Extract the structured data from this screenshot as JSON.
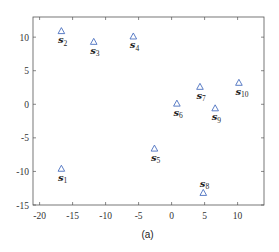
{
  "caption": "(a)",
  "colors": {
    "marker": "#4a6fc0",
    "axis": "#555555",
    "text": "#222222"
  },
  "chart_data": {
    "type": "scatter",
    "title": "",
    "xlabel": "",
    "ylabel": "",
    "xlim": [
      -21,
      14
    ],
    "ylim": [
      -15,
      13
    ],
    "xticks": [
      -20,
      -15,
      -10,
      -5,
      0,
      5,
      10
    ],
    "yticks": [
      -15,
      -10,
      -5,
      0,
      5,
      10
    ],
    "grid": false,
    "legend": null,
    "marker": "triangle-up-open",
    "points": [
      {
        "label": "s",
        "sub": "1",
        "x": -16.7,
        "y": -9.6,
        "label_pos": "below"
      },
      {
        "label": "s",
        "sub": "2",
        "x": -16.7,
        "y": 10.9,
        "label_pos": "below"
      },
      {
        "label": "s",
        "sub": "3",
        "x": -11.8,
        "y": 9.3,
        "label_pos": "below"
      },
      {
        "label": "s",
        "sub": "4",
        "x": -5.8,
        "y": 10.1,
        "label_pos": "below"
      },
      {
        "label": "s",
        "sub": "5",
        "x": -2.6,
        "y": -6.6,
        "label_pos": "below"
      },
      {
        "label": "s",
        "sub": "6",
        "x": 0.8,
        "y": 0.1,
        "label_pos": "below"
      },
      {
        "label": "s",
        "sub": "7",
        "x": 4.3,
        "y": 2.6,
        "label_pos": "below"
      },
      {
        "label": "s",
        "sub": "8",
        "x": 4.8,
        "y": -13.2,
        "label_pos": "above"
      },
      {
        "label": "s",
        "sub": "9",
        "x": 6.6,
        "y": -0.6,
        "label_pos": "below"
      },
      {
        "label": "s",
        "sub": "10",
        "x": 10.2,
        "y": 3.2,
        "label_pos": "below"
      }
    ]
  }
}
